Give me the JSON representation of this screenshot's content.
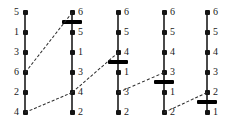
{
  "figure": {
    "background": "#ffffff",
    "spine_color": "#4a4a4a",
    "node_color": "#141414",
    "bar_color": "#000000",
    "edge_color": "#2b2b2b",
    "width": 230,
    "height": 123,
    "node_count_per_column": 6,
    "column_count": 5
  },
  "columns": [
    {
      "index": 1,
      "x": 25,
      "label_side": "left",
      "labels": [
        "5",
        "1",
        "3",
        "6",
        "2",
        "4"
      ],
      "bar": null
    },
    {
      "index": 2,
      "x": 72,
      "label_side": "right",
      "labels": [
        "6",
        "5",
        "1",
        "3",
        "4",
        "2"
      ],
      "bar": {
        "between": [
          1,
          2
        ],
        "y": 22
      }
    },
    {
      "index": 3,
      "x": 118,
      "label_side": "right",
      "labels": [
        "6",
        "5",
        "4",
        "1",
        "3",
        "2"
      ],
      "bar": {
        "between": [
          3,
          4
        ],
        "y": 62
      }
    },
    {
      "index": 4,
      "x": 164,
      "label_side": "right",
      "labels": [
        "6",
        "5",
        "4",
        "3",
        "1",
        "2"
      ],
      "bar": {
        "between": [
          4,
          5
        ],
        "y": 82
      }
    },
    {
      "index": 5,
      "x": 207,
      "label_side": "right",
      "labels": [
        "6",
        "5",
        "4",
        "3",
        "2",
        "1"
      ],
      "bar": {
        "between": [
          5,
          6
        ],
        "y": 102
      }
    }
  ],
  "node_rows_y": [
    12,
    32,
    52,
    72,
    92,
    112
  ],
  "edges": [
    {
      "from_column": 1,
      "from_row": 4,
      "to_column": 2,
      "to_row": 1,
      "value": "6"
    },
    {
      "from_column": 1,
      "from_row": 6,
      "to_column": 2,
      "to_row": 5,
      "value": "4"
    },
    {
      "from_column": 2,
      "from_row": 5,
      "to_column": 3,
      "to_row": 3,
      "value": "4"
    },
    {
      "from_column": 3,
      "from_row": 5,
      "to_column": 4,
      "to_row": 4,
      "value": "3"
    },
    {
      "from_column": 4,
      "from_row": 6,
      "to_column": 5,
      "to_row": 5,
      "value": "2"
    }
  ]
}
